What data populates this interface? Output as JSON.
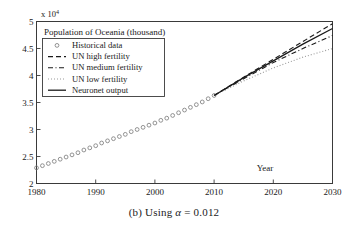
{
  "figure": {
    "caption_prefix": "(b) Using ",
    "caption_symbol": "α",
    "caption_value": " = 0.012",
    "caption_full": "(b) Using α = 0.012"
  },
  "axis": {
    "y_multiplier": "x 10",
    "y_multiplier_exp": "4",
    "x_label": "Year",
    "x_ticks": [
      "1980",
      "1990",
      "2000",
      "2010",
      "2020",
      "2030"
    ],
    "y_ticks": [
      "2",
      "2.5",
      "3",
      "3.5",
      "4",
      "4.5",
      "5"
    ],
    "xlim": [
      1980,
      2030
    ],
    "ylim": [
      2,
      5
    ],
    "grid": false,
    "axis_color": "#3a3a3a"
  },
  "chart_data": {
    "type": "line",
    "title": "Population of Oceania (thousand)",
    "xlabel": "Year",
    "ylabel": "",
    "y_scale_note": "values in units of 10^4 thousand",
    "xlim": [
      1980,
      2030
    ],
    "ylim": [
      2,
      5
    ],
    "grid": false,
    "legend_position": "upper left",
    "series": [
      {
        "name": "Historical data",
        "style": "markers",
        "marker": "circle-open",
        "color": "#808080",
        "x": [
          1980,
          1981,
          1982,
          1983,
          1984,
          1985,
          1986,
          1987,
          1988,
          1989,
          1990,
          1991,
          1992,
          1993,
          1994,
          1995,
          1996,
          1997,
          1998,
          1999,
          2000,
          2001,
          2002,
          2003,
          2004,
          2005,
          2006,
          2007,
          2008,
          2009,
          2010
        ],
        "y": [
          2.29,
          2.33,
          2.37,
          2.41,
          2.45,
          2.49,
          2.53,
          2.57,
          2.62,
          2.66,
          2.7,
          2.75,
          2.79,
          2.83,
          2.87,
          2.91,
          2.96,
          3.0,
          3.04,
          3.08,
          3.12,
          3.17,
          3.21,
          3.26,
          3.31,
          3.36,
          3.41,
          3.46,
          3.51,
          3.57,
          3.63
        ]
      },
      {
        "name": "UN high fertility",
        "style": "dashed",
        "color": "#1a1a1a",
        "x": [
          2010,
          2015,
          2020,
          2025,
          2030
        ],
        "y": [
          3.63,
          3.97,
          4.3,
          4.63,
          4.96
        ]
      },
      {
        "name": "UN medium fertility",
        "style": "dashdot",
        "color": "#1a1a1a",
        "x": [
          2010,
          2015,
          2020,
          2025,
          2030
        ],
        "y": [
          3.63,
          3.94,
          4.24,
          4.5,
          4.74
        ]
      },
      {
        "name": "UN low fertility",
        "style": "dotted",
        "color": "#9a9a9a",
        "x": [
          2010,
          2015,
          2020,
          2025,
          2030
        ],
        "y": [
          3.63,
          3.9,
          4.14,
          4.34,
          4.5
        ]
      },
      {
        "name": "Neuronet output",
        "style": "solid",
        "color": "#1a1a1a",
        "x": [
          2010,
          2015,
          2020,
          2025,
          2030
        ],
        "y": [
          3.63,
          3.96,
          4.27,
          4.58,
          4.87
        ]
      }
    ]
  },
  "legend": {
    "items": [
      {
        "label": "Historical data",
        "style": "markers"
      },
      {
        "label": "UN high fertility",
        "style": "dashed"
      },
      {
        "label": "UN medium fertility",
        "style": "dashdot"
      },
      {
        "label": "UN low fertility",
        "style": "dotted"
      },
      {
        "label": "Neuronet output",
        "style": "solid"
      }
    ]
  }
}
